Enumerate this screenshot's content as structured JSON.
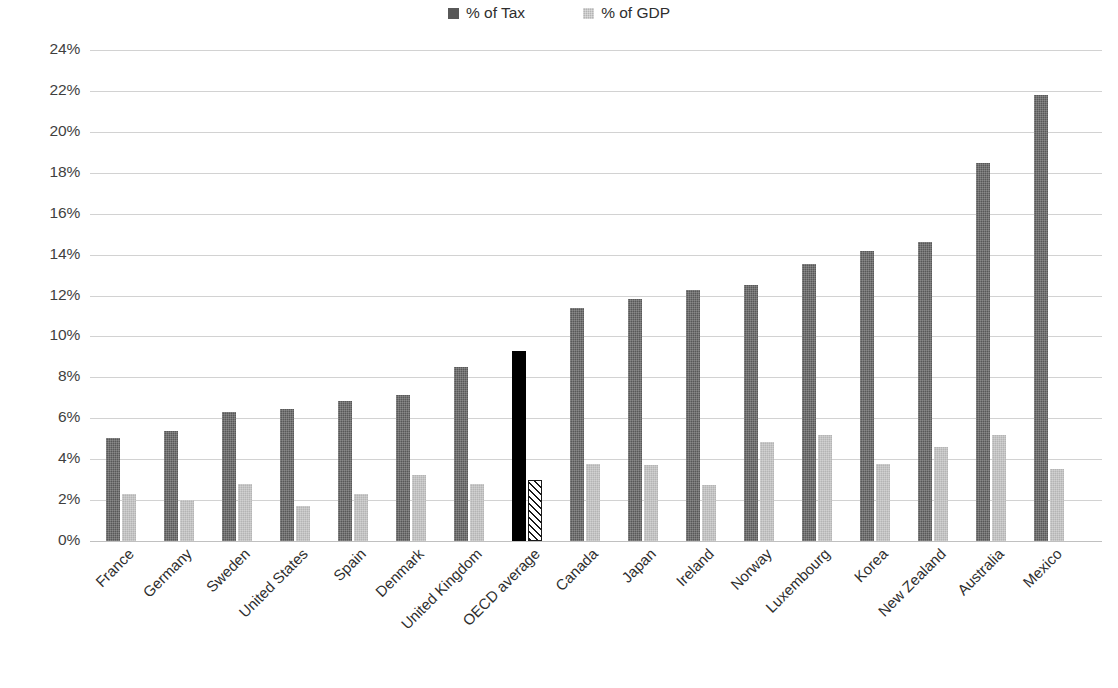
{
  "chart_data": {
    "type": "bar",
    "title": "",
    "xlabel": "",
    "ylabel": "",
    "ylim": [
      0,
      24
    ],
    "ytick_step": 2,
    "ytick_labels": [
      "0%",
      "2%",
      "4%",
      "6%",
      "8%",
      "10%",
      "12%",
      "14%",
      "16%",
      "18%",
      "20%",
      "22%",
      "24%"
    ],
    "grid": true,
    "legend_position": "top-center",
    "categories": [
      "France",
      "Germany",
      "Sweden",
      "United States",
      "Spain",
      "Denmark",
      "United Kingdom",
      "OECD average",
      "Canada",
      "Japan",
      "Ireland",
      "Norway",
      "Luxembourg",
      "Korea",
      "New Zealand",
      "Australia",
      "Mexico"
    ],
    "highlight_category": "OECD average",
    "series": [
      {
        "name": "% of Tax",
        "color": "#585858",
        "values": [
          5.05,
          5.4,
          6.3,
          6.45,
          6.85,
          7.15,
          8.5,
          9.3,
          11.4,
          11.85,
          12.25,
          12.5,
          13.55,
          14.2,
          14.6,
          18.5,
          21.8
        ]
      },
      {
        "name": "% of GDP",
        "color": "#b4b4b4",
        "values": [
          2.3,
          2.0,
          2.8,
          1.7,
          2.3,
          3.25,
          2.8,
          3.0,
          3.75,
          3.7,
          2.75,
          4.85,
          5.2,
          3.75,
          4.6,
          5.2,
          3.5
        ]
      }
    ]
  },
  "legend": {
    "items": [
      {
        "label": "% of Tax",
        "swatch": "tax-swatch-icon"
      },
      {
        "label": "% of GDP",
        "swatch": "gdp-swatch-icon"
      }
    ]
  },
  "colors": {
    "bar_tax": "#585858",
    "bar_gdp": "#b4b4b4",
    "highlight_tax": "#000000",
    "highlight_gdp_border": "#1a1a1a",
    "gridline": "#d2d2d2",
    "text": "#2e2e2e",
    "background": "#ffffff"
  }
}
